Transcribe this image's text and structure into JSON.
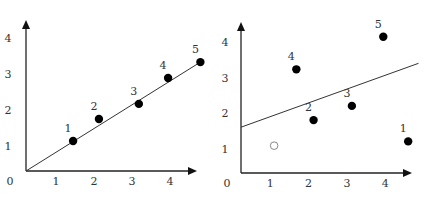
{
  "chart_data": [
    {
      "type": "scatter",
      "title": "",
      "xlabel": "",
      "ylabel": "",
      "xlim": [
        0,
        4.7
      ],
      "ylim": [
        0,
        4.5
      ],
      "x_ticks": [
        "0",
        "1",
        "2",
        "3",
        "4"
      ],
      "y_ticks": [
        "1",
        "2",
        "3",
        "4"
      ],
      "grid": false,
      "legend": null,
      "points": [
        {
          "label": "1",
          "x": 1.45,
          "y": 1.14,
          "filled": true
        },
        {
          "label": "2",
          "x": 2.13,
          "y": 1.75,
          "filled": true
        },
        {
          "label": "3",
          "x": 3.18,
          "y": 2.17,
          "filled": true
        },
        {
          "label": "4",
          "x": 3.95,
          "y": 2.89,
          "filled": true
        },
        {
          "label": "5",
          "x": 4.8,
          "y": 3.33,
          "filled": true
        }
      ],
      "fit_line": {
        "x1": 0.2,
        "y1": 0.3,
        "x2": 4.8,
        "y2": 3.33
      },
      "frame": {
        "ox": 26,
        "oy": 171,
        "x_end": 197,
        "y_end": 20,
        "x0px": 18,
        "xscale": 38,
        "y0px": 182,
        "yscale": 36,
        "xtick_y": 185,
        "ytick_x": 8
      }
    },
    {
      "type": "scatter",
      "title": "",
      "xlabel": "",
      "ylabel": "",
      "xlim": [
        0,
        4.7
      ],
      "ylim": [
        0,
        4.5
      ],
      "x_ticks": [
        "0",
        "1",
        "2",
        "3",
        "4"
      ],
      "y_ticks": [
        "1",
        "2",
        "3",
        "4"
      ],
      "grid": false,
      "legend": null,
      "points": [
        {
          "label": "1",
          "x": 4.6,
          "y": 1.2,
          "filled": true
        },
        {
          "label": "2",
          "x": 2.13,
          "y": 1.8,
          "filled": true
        },
        {
          "label": "3",
          "x": 3.13,
          "y": 2.2,
          "filled": true
        },
        {
          "label": "4",
          "x": 1.68,
          "y": 3.23,
          "filled": true
        },
        {
          "label": "5",
          "x": 3.95,
          "y": 4.15,
          "filled": true
        },
        {
          "label": "",
          "x": 1.1,
          "y": 1.08,
          "filled": false
        }
      ],
      "fit_line": {
        "x1": 0.15,
        "y1": 1.6,
        "x2": 4.87,
        "y2": 3.4
      },
      "frame": {
        "ox": 241,
        "oy": 173,
        "x_end": 412,
        "y_end": 22,
        "x0px": 232,
        "xscale": 38.3,
        "y0px": 184,
        "yscale": 35.5,
        "xtick_y": 187,
        "ytick_x": 225
      }
    }
  ]
}
